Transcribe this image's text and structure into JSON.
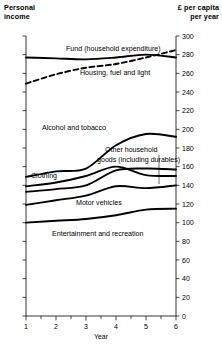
{
  "header": {
    "left_line1": "Personal",
    "left_line2": "income",
    "right_line1": "£ per capita",
    "right_line2": "per year"
  },
  "chart_data": {
    "type": "line",
    "title": "",
    "subtitle": "",
    "xlabel": "Year",
    "ylabel": "£ per capita per year",
    "left_axis_label": "Personal income",
    "xlim": [
      1,
      6
    ],
    "ylim": [
      0,
      300
    ],
    "x": [
      1,
      2,
      3,
      4,
      5,
      6
    ],
    "xticks": [
      1,
      2,
      3,
      4,
      5,
      6
    ],
    "xtick_labels": [
      "1",
      "2",
      "3",
      "4",
      "5",
      "6"
    ],
    "x_minor_ticks": [
      1.5,
      2.5,
      3.5,
      4.5,
      5.5
    ],
    "yticks": [
      0,
      20,
      40,
      60,
      80,
      100,
      120,
      140,
      160,
      180,
      200,
      220,
      240,
      260,
      280,
      300
    ],
    "ytick_labels": [
      "0",
      "20",
      "40",
      "60",
      "80",
      "100",
      "120",
      "140",
      "160",
      "180",
      "200",
      "220",
      "240",
      "260",
      "280",
      "300"
    ],
    "grid": false,
    "legend_position": "inline-labels",
    "series": [
      {
        "name": "Fund (household expenditure)",
        "label": "Fund (household expenditure)",
        "style": "solid",
        "color": "#000000",
        "values": [
          277,
          276,
          275,
          277,
          280,
          277
        ],
        "label_x": 66,
        "label_y": 51,
        "label_anchor": "start"
      },
      {
        "name": "Housing, fuel and light",
        "label": "Housing, fuel and light",
        "style": "dashed",
        "color": "#000000",
        "values": [
          249,
          259,
          266,
          270,
          277,
          285
        ],
        "label_x": 80,
        "label_y": 75,
        "label_anchor": "start"
      },
      {
        "name": "Alcohol and tobacco",
        "label": "Alcohol and tobacco",
        "style": "solid",
        "color": "#000000",
        "values": [
          149,
          155,
          158,
          183,
          195,
          192
        ],
        "label_x": 42,
        "label_y": 130,
        "label_anchor": "start"
      },
      {
        "name": "Other household goods (including durables)",
        "label_line1": "Other household",
        "label_line2": "goods (including durables)",
        "style": "solid",
        "color": "#000000",
        "values": [
          139,
          143,
          150,
          160,
          151,
          150
        ],
        "label_x": 105,
        "label_y": 152,
        "label_anchor": "start"
      },
      {
        "name": "Clothing",
        "label": "Clothing",
        "style": "solid",
        "color": "#000000",
        "values": [
          133,
          136,
          140,
          156,
          158,
          157
        ],
        "label_x": 31,
        "label_y": 178,
        "label_anchor": "start"
      },
      {
        "name": "Motor vehicles",
        "label": "Motor vehicles",
        "style": "solid",
        "color": "#000000",
        "values": [
          119,
          124,
          129,
          139,
          137,
          140
        ],
        "label_x": 76,
        "label_y": 205,
        "label_anchor": "start"
      },
      {
        "name": "Entertainment and recreation",
        "label": "Entertainment and recreation",
        "style": "solid",
        "color": "#000000",
        "values": [
          100,
          102,
          104,
          108,
          114,
          115
        ],
        "label_x": 52,
        "label_y": 236,
        "label_anchor": "start"
      }
    ],
    "annotations": [
      {
        "type": "leader-line",
        "for": "Other household goods (including durables)",
        "x": 159,
        "y_top": 155,
        "y_bottom": 184
      }
    ]
  }
}
